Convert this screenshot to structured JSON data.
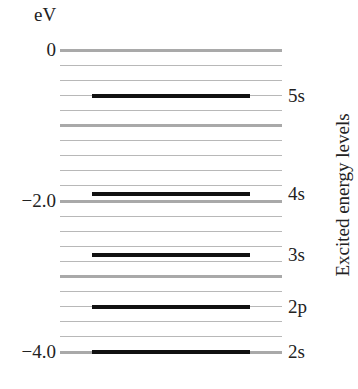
{
  "diagram": {
    "unit_label": "eV",
    "axis_title": "Excited energy levels",
    "colors": {
      "grid_line": "#b8b8b8",
      "major_line": "#a9a9a9",
      "level_line": "#111111"
    },
    "scale": {
      "top_px": 50,
      "px_per_eV": 75.5,
      "eV_max": 0,
      "eV_min": -4.0,
      "minor_step_eV": 0.2,
      "major_step_eV": 1.0
    },
    "ticks": [
      {
        "label": "0",
        "value": 0
      },
      {
        "label": "−2.0",
        "value": -2.0
      },
      {
        "label": "−4.0",
        "value": -4.0
      }
    ],
    "levels": [
      {
        "label": "5s",
        "value": -0.61
      },
      {
        "label": "4s",
        "value": -1.91
      },
      {
        "label": "3s",
        "value": -2.72
      },
      {
        "label": "2p",
        "value": -3.41
      },
      {
        "label": "2s",
        "value": -4.0
      }
    ]
  }
}
